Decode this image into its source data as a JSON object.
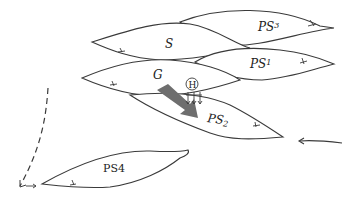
{
  "diagram": {
    "type": "schematic",
    "colors": {
      "outline": "#3a3a3a",
      "fill": "#ffffff",
      "arrow_large": "#6e6e6e",
      "text": "#222222"
    },
    "bodies": [
      {
        "id": "S",
        "label": "S"
      },
      {
        "id": "PS3",
        "label": "PS",
        "subscript": "3"
      },
      {
        "id": "PS1",
        "label": "PS",
        "subscript": "1"
      },
      {
        "id": "G",
        "label": "G"
      },
      {
        "id": "PS2",
        "label": "PS",
        "subscript": "2"
      },
      {
        "id": "PS4",
        "label": "PS",
        "subscript": "4"
      }
    ],
    "markers": {
      "H": {
        "label": "H",
        "style": "circled"
      }
    },
    "arrows": [
      {
        "name": "large-gray-arrow",
        "from": "G",
        "to": "PS2"
      },
      {
        "name": "small-down-arrows",
        "from": "H",
        "count": 3
      },
      {
        "name": "right-incoming-arrow",
        "direction": "left"
      },
      {
        "name": "left-dashed-arrow",
        "direction": "down"
      }
    ]
  }
}
